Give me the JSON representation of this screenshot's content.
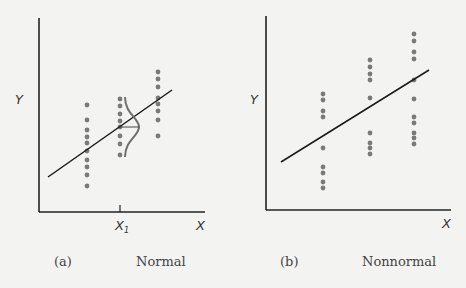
{
  "panels": [
    {
      "id": "a",
      "tag": "(a)",
      "caption": "Normal",
      "y_label": "Y",
      "x_label": "X",
      "x_tick_label": "X",
      "x_tick_sub": "1",
      "regression_line": {
        "x1": 48,
        "y1": 177,
        "x2": 172,
        "y2": 90
      },
      "columns": [
        {
          "x": 87,
          "ys": [
            105,
            120,
            130,
            137,
            143,
            151,
            160,
            167,
            175,
            186
          ]
        },
        {
          "x": 120,
          "ys": [
            99,
            106,
            114,
            121,
            127,
            136,
            144,
            155
          ]
        },
        {
          "x": 158,
          "ys": [
            72,
            79,
            87,
            98,
            104,
            111,
            120,
            136
          ]
        }
      ],
      "normal_curve_at": "X1"
    },
    {
      "id": "b",
      "tag": "(b)",
      "caption": "Nonnormal",
      "y_label": "Y",
      "x_label": "X",
      "regression_line": {
        "x1": 281,
        "y1": 162,
        "x2": 429,
        "y2": 70
      },
      "columns": [
        {
          "x": 323,
          "ys": [
            94,
            100,
            111,
            117,
            148,
            167,
            173,
            182,
            188
          ]
        },
        {
          "x": 370,
          "ys": [
            60,
            67,
            74,
            80,
            98,
            133,
            143,
            148,
            154
          ]
        },
        {
          "x": 414,
          "ys": [
            34,
            41,
            52,
            59,
            80,
            99,
            117,
            123,
            133,
            138,
            144
          ]
        }
      ]
    }
  ],
  "colors": {
    "axis": "#222222",
    "dot": "#7a7a7a",
    "curve": "#6e6e6e",
    "background": "#f3f3f1"
  }
}
